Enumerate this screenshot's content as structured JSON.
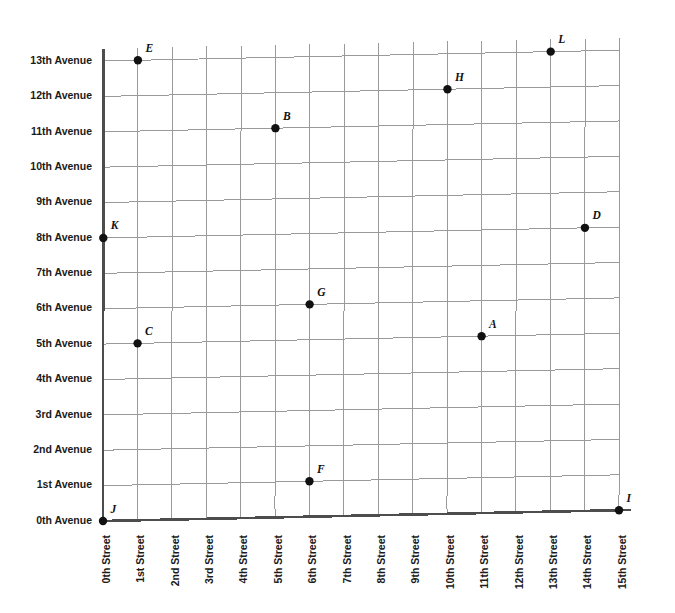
{
  "chart_data": {
    "type": "scatter",
    "title": "",
    "subtitle": "",
    "xlabel": "",
    "ylabel": "",
    "grid": true,
    "legend": false,
    "legend_position": "none",
    "xlim": [
      0,
      15
    ],
    "ylim": [
      0,
      13
    ],
    "x_tick_labels": [
      "0th Street",
      "1st Street",
      "2nd Street",
      "3rd Street",
      "4th Street",
      "5th Street",
      "6th Street",
      "7th Street",
      "8th Street",
      "9th Street",
      "10th Street",
      "11th Street",
      "12th Street",
      "13th Street",
      "14th Street",
      "15th Street"
    ],
    "x_tick_values": [
      0,
      1,
      2,
      3,
      4,
      5,
      6,
      7,
      8,
      9,
      10,
      11,
      12,
      13,
      14,
      15
    ],
    "y_tick_labels": [
      "0th Avenue",
      "1st Avenue",
      "2nd Avenue",
      "3rd Avenue",
      "4th Avenue",
      "5th Avenue",
      "6th Avenue",
      "7th Avenue",
      "8th Avenue",
      "9th Avenue",
      "10th Avenue",
      "11th Avenue",
      "12th Avenue",
      "13th Avenue"
    ],
    "y_tick_values": [
      0,
      1,
      2,
      3,
      4,
      5,
      6,
      7,
      8,
      9,
      10,
      11,
      12,
      13
    ],
    "point_color": "#111111",
    "grid_color": "#9a9a9a",
    "axis_color": "#4d4d4d",
    "points": [
      {
        "label": "A",
        "x": 11,
        "y": 5,
        "x_name": "11th Street",
        "y_name": "5th Avenue"
      },
      {
        "label": "B",
        "x": 5,
        "y": 11,
        "x_name": "5th Street",
        "y_name": "11th Avenue"
      },
      {
        "label": "C",
        "x": 1,
        "y": 5,
        "x_name": "1st Street",
        "y_name": "5th Avenue"
      },
      {
        "label": "D",
        "x": 14,
        "y": 8,
        "x_name": "14th Street",
        "y_name": "8th Avenue"
      },
      {
        "label": "E",
        "x": 1,
        "y": 13,
        "x_name": "1st Street",
        "y_name": "13th Avenue"
      },
      {
        "label": "F",
        "x": 6,
        "y": 1,
        "x_name": "6th Street",
        "y_name": "1st Avenue"
      },
      {
        "label": "G",
        "x": 6,
        "y": 6,
        "x_name": "6th Street",
        "y_name": "6th Avenue"
      },
      {
        "label": "H",
        "x": 10,
        "y": 12,
        "x_name": "10th Street",
        "y_name": "12th Avenue"
      },
      {
        "label": "I",
        "x": 15,
        "y": 0,
        "x_name": "15th Street",
        "y_name": "0th Avenue"
      },
      {
        "label": "J",
        "x": 0,
        "y": 0,
        "x_name": "0th Street",
        "y_name": "0th Avenue"
      },
      {
        "label": "K",
        "x": 0,
        "y": 8,
        "x_name": "0th Street",
        "y_name": "8th Avenue"
      },
      {
        "label": "L",
        "x": 13,
        "y": 13,
        "x_name": "13th Street",
        "y_name": "13th Avenue"
      }
    ]
  }
}
